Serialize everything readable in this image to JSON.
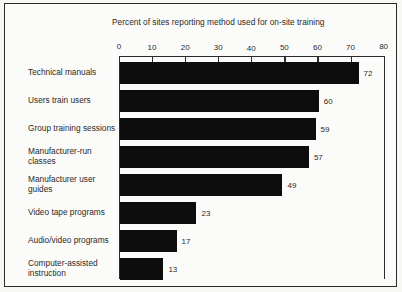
{
  "chart_data": {
    "type": "bar",
    "orientation": "horizontal",
    "title": "Percent of sites reporting method used for on-site training",
    "xlabel": "",
    "ylabel": "",
    "xlim": [
      0,
      80
    ],
    "xticks": [
      0,
      10,
      20,
      30,
      40,
      50,
      60,
      70,
      80
    ],
    "grid": false,
    "legend": "none",
    "bar_color": "#0d0d0d",
    "categories": [
      "Technical manuals",
      "Users train users",
      "Group training sessions",
      "Manufacturer-run classes",
      "Manufacturer user guides",
      "Video tape programs",
      "Audio/video programs",
      "Computer-assisted instruction"
    ],
    "values": [
      72,
      60,
      59,
      57,
      49,
      23,
      17,
      13
    ],
    "value_labels": [
      "72",
      "60",
      "59",
      "57",
      "49",
      "23",
      "17",
      "13"
    ],
    "tick_labels": [
      "0",
      "10",
      "20",
      "30",
      "40",
      "50",
      "60",
      "70",
      "80"
    ],
    "category_label_lines": [
      [
        "Technical manuals"
      ],
      [
        "Users train users"
      ],
      [
        "Group training sessions"
      ],
      [
        "Manufacturer-run",
        "classes"
      ],
      [
        "Manufacturer user",
        "guides"
      ],
      [
        "Video tape programs"
      ],
      [
        "Audio/video programs"
      ],
      [
        "Computer-assisted",
        "instruction"
      ]
    ],
    "categories_multiline": [
      "Technical manuals",
      "Users train users",
      "Group training sessions",
      "Manufacturer-run\nclasses",
      "Manufacturer user\nguides",
      "Video tape programs",
      "Audio/video programs",
      "Computer-assisted\ninstruction"
    ]
  }
}
